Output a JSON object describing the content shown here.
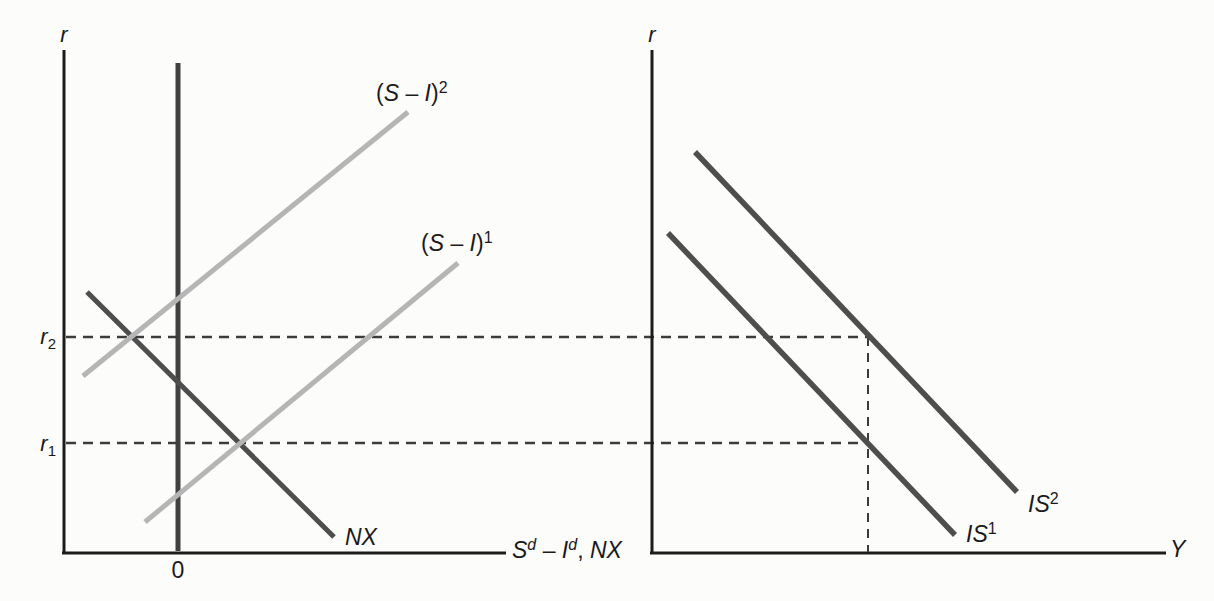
{
  "figure": {
    "background": "#fcfcfa",
    "canvas": {
      "width": 1214,
      "height": 601
    },
    "colors": {
      "axis": "#1c1c1c",
      "dark": "#4e4e4e",
      "light": "#b5b5b5",
      "dash": "#3c3c3c",
      "zero": "#414141",
      "text": "#1a1a1a"
    }
  },
  "chart_data": {
    "type": "line",
    "coordinate_space": "screen pixels, y increases downward, canvas 1214x601, axes unlabeled (qualitative diagram)",
    "grid": "off",
    "legend": "none",
    "key_values": {
      "interest_rates": [
        "r1",
        "r2"
      ],
      "r1_pixel_y": 443,
      "r2_pixel_y": 337,
      "equilibrium_output_pixel_x": 868
    },
    "panels": [
      {
        "name": "left-panel-saving-investment-nx",
        "x_axis_label_text": "Sd - Id, NX",
        "y_axis_label_text": "r",
        "lines": [
          {
            "name": "left-y-axis",
            "x1": 64,
            "y1": 50,
            "x2": 64,
            "y2": 554,
            "color": "axis",
            "width": 3
          },
          {
            "name": "left-x-axis",
            "x1": 62,
            "y1": 553,
            "x2": 506,
            "y2": 553,
            "color": "axis",
            "width": 3
          },
          {
            "name": "zero-vertical-line",
            "x1": 178,
            "y1": 63,
            "x2": 178,
            "y2": 551,
            "color": "zero",
            "width": 5
          },
          {
            "name": "r2-dashed-line",
            "x1": 66,
            "y1": 337,
            "x2": 869,
            "y2": 337,
            "color": "dash",
            "width": 2.5,
            "dash": "10 7"
          },
          {
            "name": "r1-dashed-line",
            "x1": 66,
            "y1": 443,
            "x2": 866,
            "y2": 443,
            "color": "dash",
            "width": 2.5,
            "dash": "10 7"
          },
          {
            "name": "nx-curve",
            "x1": 87,
            "y1": 292,
            "x2": 334,
            "y2": 537,
            "color": "dark",
            "width": 5
          },
          {
            "name": "s-minus-i-2-curve",
            "x1": 83,
            "y1": 376,
            "x2": 408,
            "y2": 112,
            "color": "light",
            "width": 5
          },
          {
            "name": "s-minus-i-1-curve",
            "x1": 145,
            "y1": 522,
            "x2": 458,
            "y2": 263,
            "color": "light",
            "width": 5
          }
        ],
        "labels": [
          {
            "name": "left-y-axis-label",
            "x": 64,
            "y": 42,
            "anchor": "middle",
            "size": 22,
            "parts": [
              {
                "t": "r",
                "i": true
              }
            ]
          },
          {
            "name": "s-minus-i-2-label",
            "x": 376,
            "y": 101,
            "anchor": "start",
            "size": 23,
            "parts": [
              {
                "t": "("
              },
              {
                "t": "S",
                "i": true
              },
              {
                "t": " – "
              },
              {
                "t": "I",
                "i": true
              },
              {
                "t": ")"
              },
              {
                "t": "2",
                "sup": true
              }
            ]
          },
          {
            "name": "s-minus-i-1-label",
            "x": 421,
            "y": 251,
            "anchor": "start",
            "size": 23,
            "parts": [
              {
                "t": "("
              },
              {
                "t": "S",
                "i": true
              },
              {
                "t": " – "
              },
              {
                "t": "I",
                "i": true
              },
              {
                "t": ")"
              },
              {
                "t": "1",
                "sup": true
              }
            ]
          },
          {
            "name": "nx-curve-label",
            "x": 345,
            "y": 545,
            "anchor": "start",
            "size": 23,
            "parts": [
              {
                "t": "NX",
                "i": true
              }
            ]
          },
          {
            "name": "r2-tick-label",
            "x": 56,
            "y": 344,
            "anchor": "end",
            "size": 22,
            "parts": [
              {
                "t": "r",
                "i": true
              },
              {
                "t": "2",
                "sub": true
              }
            ]
          },
          {
            "name": "r1-tick-label",
            "x": 56,
            "y": 451,
            "anchor": "end",
            "size": 22,
            "parts": [
              {
                "t": "r",
                "i": true
              },
              {
                "t": "1",
                "sub": true
              }
            ]
          },
          {
            "name": "zero-tick-label",
            "x": 178,
            "y": 578,
            "anchor": "middle",
            "size": 23,
            "parts": [
              {
                "t": "0"
              }
            ]
          },
          {
            "name": "left-x-axis-label",
            "x": 512,
            "y": 558,
            "anchor": "start",
            "size": 23,
            "parts": [
              {
                "t": "S",
                "i": true
              },
              {
                "t": "d",
                "sup": true,
                "i": true
              },
              {
                "t": " – "
              },
              {
                "t": "I",
                "i": true
              },
              {
                "t": "d",
                "sup": true,
                "i": true
              },
              {
                "t": ", "
              },
              {
                "t": "NX",
                "i": true
              }
            ]
          }
        ]
      },
      {
        "name": "right-panel-is-curves",
        "x_axis_label_text": "Y",
        "y_axis_label_text": "r",
        "lines": [
          {
            "name": "right-y-axis",
            "x1": 652,
            "y1": 50,
            "x2": 652,
            "y2": 554,
            "color": "axis",
            "width": 3
          },
          {
            "name": "right-x-axis",
            "x1": 650,
            "y1": 553,
            "x2": 1166,
            "y2": 553,
            "color": "axis",
            "width": 3
          },
          {
            "name": "output-vertical-dashed-line",
            "x1": 868,
            "y1": 337,
            "x2": 868,
            "y2": 552,
            "color": "dash",
            "width": 2,
            "dash": "9 7"
          },
          {
            "name": "is2-curve",
            "x1": 695,
            "y1": 152,
            "x2": 1017,
            "y2": 492,
            "color": "dark",
            "width": 5.5
          },
          {
            "name": "is1-curve",
            "x1": 668,
            "y1": 233,
            "x2": 955,
            "y2": 535,
            "color": "dark",
            "width": 5.5
          }
        ],
        "labels": [
          {
            "name": "right-y-axis-label",
            "x": 652,
            "y": 42,
            "anchor": "middle",
            "size": 22,
            "parts": [
              {
                "t": "r",
                "i": true
              }
            ]
          },
          {
            "name": "is2-curve-label",
            "x": 1028,
            "y": 512,
            "anchor": "start",
            "size": 23,
            "parts": [
              {
                "t": "IS",
                "i": true
              },
              {
                "t": "2",
                "sup": true
              }
            ]
          },
          {
            "name": "is1-curve-label",
            "x": 966,
            "y": 542,
            "anchor": "start",
            "size": 23,
            "parts": [
              {
                "t": "IS",
                "i": true
              },
              {
                "t": "1",
                "sup": true
              }
            ]
          },
          {
            "name": "right-x-axis-label",
            "x": 1170,
            "y": 557,
            "anchor": "start",
            "size": 23,
            "parts": [
              {
                "t": "Y",
                "i": true
              }
            ]
          }
        ]
      }
    ]
  }
}
